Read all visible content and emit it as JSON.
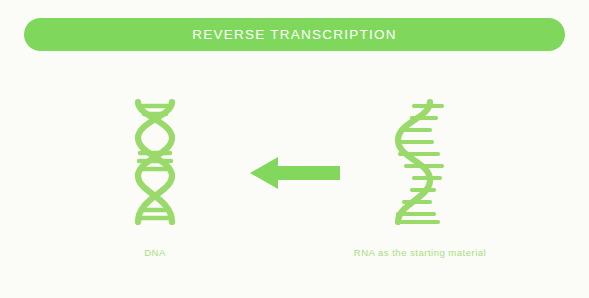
{
  "banner": {
    "title": "REVERSE TRANSCRIPTION",
    "background_color": "#7fd75c",
    "text_color": "#ffffff"
  },
  "page": {
    "background_color": "#fbfbf8",
    "accent_color": "#8ed860",
    "molecule_color": "#9ada6b",
    "label_color": "#a9dd7e"
  },
  "diagram": {
    "type": "process-flow",
    "direction": "right-to-left",
    "source": {
      "icon": "rna-single-strand-icon",
      "label": "RNA as the starting material"
    },
    "arrow": {
      "icon": "arrow-left-icon",
      "color": "#81d85d",
      "points": "left"
    },
    "product": {
      "icon": "dna-double-helix-icon",
      "label": "DNA"
    }
  }
}
